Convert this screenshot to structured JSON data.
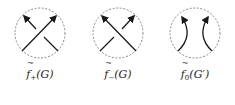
{
  "figure": {
    "panels": [
      {
        "id": "f-plus",
        "type": "positive-crossing",
        "label_func": "f",
        "label_sub": "+",
        "label_arg": "(G)",
        "over_strand": "bottom-left-to-top-right"
      },
      {
        "id": "f-minus",
        "type": "negative-crossing",
        "label_func": "f",
        "label_sub": "−",
        "label_arg": "(G)",
        "over_strand": "bottom-right-to-top-left"
      },
      {
        "id": "f-zero",
        "type": "smoothing",
        "label_func": "f",
        "label_sub": "0",
        "label_arg": "(G′)",
        "over_strand": "none"
      }
    ],
    "colors": {
      "strand": "#1a1a1a",
      "circle": "#7a7a7a"
    }
  }
}
